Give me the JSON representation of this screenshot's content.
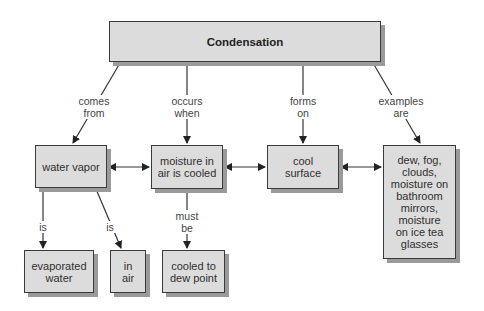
{
  "diagram": {
    "title": "Condensation",
    "nodes": {
      "root": "Condensation",
      "water_vapor": "water vapor",
      "moisture_cooled": "moisture in\nair is cooled",
      "cool_surface": "cool\nsurface",
      "examples": "dew, fog,\nclouds,\nmoisture on\nbathroom\nmirrors,\nmoisture\non ice tea\nglasses",
      "evaporated_water": "evaporated\nwater",
      "in_air": "in\nair",
      "cooled_dew_point": "cooled to\ndew point"
    },
    "links": {
      "comes_from": "comes\nfrom",
      "occurs_when": "occurs\nwhen",
      "forms_on": "forms\non",
      "examples_are": "examples\nare",
      "is_1": "is",
      "is_2": "is",
      "must_be": "must\nbe"
    },
    "colors": {
      "box_fill": "#dcdcdc",
      "box_border": "#3a3a3a",
      "shadow": "#9a9a9a",
      "line": "#333333"
    }
  }
}
